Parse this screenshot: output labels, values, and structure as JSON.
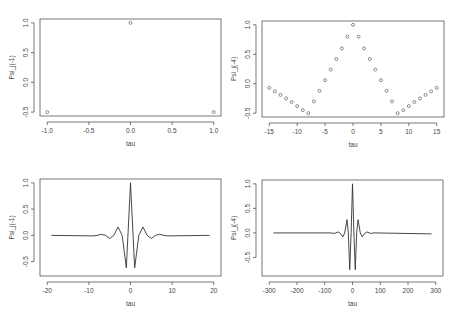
{
  "chart_data": [
    {
      "id": "p1",
      "type": "scatter",
      "title": "",
      "xlabel": "tau",
      "ylabel": "Psi_j(-1)",
      "xlim": [
        -1.0,
        1.0
      ],
      "ylim": [
        -0.5,
        1.0
      ],
      "xticks": [
        -1.0,
        -0.5,
        0.0,
        0.5,
        1.0
      ],
      "xtick_labels": [
        "-1.0",
        "-0.5",
        "0.0",
        "0.5",
        "1.0"
      ],
      "yticks": [
        -0.5,
        0.0,
        0.5,
        1.0
      ],
      "ytick_labels": [
        "-0.5",
        "0.0",
        "0.5",
        "1.0"
      ],
      "grid": false,
      "x": [
        -1,
        0,
        1
      ],
      "y": [
        -0.5,
        1.0,
        -0.5
      ],
      "frame": {
        "left": 40,
        "top": 19,
        "right": 221,
        "bottom": 116
      }
    },
    {
      "id": "p2",
      "type": "scatter",
      "title": "",
      "xlabel": "tau",
      "ylabel": "Psi_j(-4)",
      "xlim": [
        -15,
        15
      ],
      "ylim": [
        -0.5,
        1.0
      ],
      "xticks": [
        -15,
        -10,
        -5,
        0,
        5,
        10,
        15
      ],
      "xtick_labels": [
        "-15",
        "-10",
        "-5",
        "0",
        "5",
        "10",
        "15"
      ],
      "yticks": [
        -0.5,
        0.0,
        0.5,
        1.0
      ],
      "ytick_labels": [
        "-0.5",
        "0.0",
        "0.5",
        "1.0"
      ],
      "grid": false,
      "x": [
        -15,
        -14,
        -13,
        -12,
        -11,
        -10,
        -9,
        -8,
        -7,
        -6,
        -5,
        -4,
        -3,
        -2,
        -1,
        0,
        1,
        2,
        3,
        4,
        5,
        6,
        7,
        8,
        9,
        10,
        11,
        12,
        13,
        14,
        15
      ],
      "y": [
        -0.07,
        -0.13,
        -0.19,
        -0.25,
        -0.31,
        -0.38,
        -0.45,
        -0.5,
        -0.3,
        -0.12,
        0.06,
        0.24,
        0.42,
        0.6,
        0.8,
        1.0,
        0.8,
        0.6,
        0.42,
        0.24,
        0.06,
        -0.12,
        -0.3,
        -0.5,
        -0.45,
        -0.38,
        -0.31,
        -0.25,
        -0.19,
        -0.13,
        -0.07
      ],
      "frame": {
        "left": 262,
        "top": 21,
        "right": 444,
        "bottom": 117
      }
    },
    {
      "id": "p3",
      "type": "line",
      "title": "",
      "xlabel": "tau",
      "ylabel": "Psi_j(-1)",
      "xlim": [
        -20,
        20
      ],
      "ylim": [
        -0.7,
        1.0
      ],
      "xticks": [
        -20,
        -10,
        0,
        10,
        20
      ],
      "xtick_labels": [
        "-20",
        "-10",
        "0",
        "10",
        "20"
      ],
      "yticks": [
        -0.5,
        0.0,
        0.5,
        1.0
      ],
      "ytick_labels": [
        "-0.5",
        "0.0",
        "0.5",
        "1.0"
      ],
      "grid": false,
      "x": [
        -19,
        -9,
        -8,
        -7,
        -6,
        -5,
        -4,
        -3,
        -2,
        -1,
        0,
        1,
        2,
        3,
        4,
        5,
        6,
        7,
        8,
        9,
        19
      ],
      "y": [
        0.0,
        -0.01,
        0.0,
        0.02,
        0.0,
        -0.06,
        0.0,
        0.16,
        0.0,
        -0.62,
        1.0,
        -0.62,
        0.0,
        0.16,
        0.0,
        -0.06,
        0.0,
        0.02,
        0.0,
        -0.01,
        0.0
      ],
      "frame": {
        "left": 40,
        "top": 179,
        "right": 221,
        "bottom": 276
      }
    },
    {
      "id": "p4",
      "type": "line",
      "title": "",
      "xlabel": "tau",
      "ylabel": "Psi_j(-4)",
      "xlim": [
        -300,
        300
      ],
      "ylim": [
        -0.8,
        1.0
      ],
      "xticks": [
        -300,
        -200,
        -100,
        0,
        100,
        200,
        300
      ],
      "xtick_labels": [
        "-300",
        "-200",
        "-100",
        "0",
        "100",
        "200",
        "300"
      ],
      "yticks": [
        -0.5,
        0.0,
        0.5,
        1.0
      ],
      "ytick_labels": [
        "-0.5",
        "0.0",
        "0.5",
        "1.0"
      ],
      "grid": false,
      "x": [
        -285,
        -80,
        -65,
        -52,
        -42,
        -35,
        -28,
        -20,
        -15,
        -10,
        -5,
        0,
        5,
        10,
        15,
        20,
        28,
        35,
        42,
        52,
        65,
        80,
        285
      ],
      "y": [
        0.0,
        0.0,
        -0.01,
        0.02,
        -0.02,
        -0.08,
        0.0,
        0.27,
        0.0,
        -0.75,
        0.0,
        1.0,
        0.0,
        -0.75,
        0.0,
        0.27,
        0.0,
        -0.08,
        -0.02,
        0.02,
        -0.01,
        0.0,
        -0.02
      ],
      "frame": {
        "left": 262,
        "top": 180,
        "right": 443,
        "bottom": 276
      }
    }
  ]
}
